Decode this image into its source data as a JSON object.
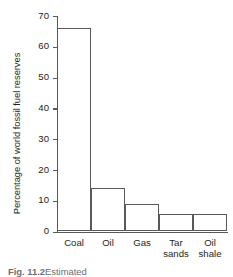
{
  "chart_data": {
    "type": "bar",
    "title": "",
    "xlabel": "",
    "ylabel": "Percentage of world fossil fuel reserves",
    "categories": [
      "Coal",
      "Oil",
      "Gas",
      "Tar sands",
      "Oil shale"
    ],
    "values": [
      66,
      14,
      9,
      5.5,
      5.5
    ],
    "ylim": [
      0,
      70
    ],
    "yticks": [
      0,
      10,
      20,
      30,
      40,
      50,
      60,
      70
    ],
    "ytick_labels": [
      "0",
      "10",
      "20",
      "30",
      "40",
      "50",
      "60",
      "70"
    ],
    "grid": false,
    "legend": "none",
    "bar_fill": "#ffffff",
    "bar_stroke": "#58595b",
    "axis_color": "#58595b",
    "text_color": "#231f20"
  },
  "axis": {
    "y_title": "Percentage of world fossil fuel reserves"
  },
  "bars": [
    {
      "label": "Coal",
      "label_line1": "Coal",
      "label_line2": "",
      "value": 66
    },
    {
      "label": "Oil",
      "label_line1": "Oil",
      "label_line2": "",
      "value": 14
    },
    {
      "label": "Gas",
      "label_line1": "Gas",
      "label_line2": "",
      "value": 9
    },
    {
      "label": "Tar sands",
      "label_line1": "Tar",
      "label_line2": "sands",
      "value": 5.5
    },
    {
      "label": "Oil shale",
      "label_line1": "Oil",
      "label_line2": "shale",
      "value": 5.5
    }
  ],
  "caption": {
    "figure_number": "Fig. 11.2",
    "text": "Estimated"
  }
}
